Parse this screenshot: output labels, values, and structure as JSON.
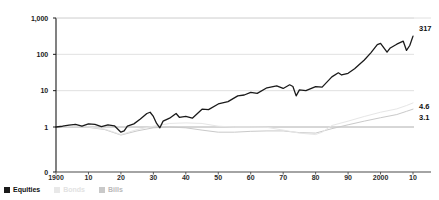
{
  "chart_data": {
    "type": "line",
    "title": "",
    "xlabel": "",
    "ylabel": "",
    "scale": "log",
    "grid": true,
    "legend_position": "bottom-left",
    "ylim": [
      1,
      1000
    ],
    "ytick_labels": [
      "1,000",
      "100",
      "10",
      "1",
      "0"
    ],
    "ytick_values": [
      1000,
      100,
      10,
      1,
      0
    ],
    "xlim": [
      1900,
      2010
    ],
    "xtick_labels": [
      "1900",
      "10",
      "20",
      "30",
      "40",
      "50",
      "60",
      "70",
      "80",
      "90",
      "2000",
      "10"
    ],
    "xtick_values": [
      1900,
      1910,
      1920,
      1930,
      1940,
      1950,
      1960,
      1970,
      1980,
      1990,
      2000,
      2010
    ],
    "end_labels": [
      {
        "name": "equities-end-value",
        "text": "317",
        "value": 317
      },
      {
        "name": "bonds-end-value",
        "text": "4.6",
        "value": 4.6
      },
      {
        "name": "bills-end-value",
        "text": "3.1",
        "value": 3.1
      }
    ],
    "series": [
      {
        "name": "Equities",
        "color": "#1a1a1a",
        "width": 1.3,
        "x": [
          1900,
          1902,
          1904,
          1906,
          1908,
          1910,
          1912,
          1914,
          1916,
          1918,
          1920,
          1921,
          1922,
          1924,
          1926,
          1928,
          1929,
          1930,
          1931,
          1932,
          1933,
          1935,
          1937,
          1938,
          1940,
          1942,
          1945,
          1947,
          1950,
          1953,
          1956,
          1958,
          1960,
          1962,
          1965,
          1968,
          1970,
          1972,
          1973,
          1974,
          1975,
          1977,
          1980,
          1982,
          1985,
          1987,
          1988,
          1990,
          1992,
          1995,
          1997,
          1999,
          2000,
          2002,
          2003,
          2005,
          2007,
          2008,
          2009,
          2010
        ],
        "y": [
          1.0,
          1.05,
          1.12,
          1.18,
          1.05,
          1.22,
          1.18,
          1.02,
          1.15,
          1.08,
          0.72,
          0.78,
          1.05,
          1.22,
          1.65,
          2.35,
          2.55,
          1.95,
          1.25,
          0.95,
          1.45,
          1.75,
          2.35,
          1.85,
          1.95,
          1.75,
          3.1,
          3.0,
          4.3,
          5.0,
          7.2,
          7.6,
          9.0,
          8.4,
          12.0,
          13.5,
          11.5,
          14.5,
          13.0,
          7.2,
          10.5,
          10.0,
          13.0,
          12.5,
          24.0,
          31.0,
          27.0,
          30.0,
          40.0,
          70.0,
          110.0,
          185.0,
          200.0,
          115.0,
          150.0,
          190.0,
          230.0,
          128.0,
          175.0,
          317.0
        ]
      },
      {
        "name": "Bonds",
        "color": "#e6e6e6",
        "width": 1.0,
        "x": [
          1900,
          1905,
          1910,
          1915,
          1920,
          1925,
          1930,
          1935,
          1940,
          1945,
          1950,
          1955,
          1960,
          1965,
          1970,
          1975,
          1980,
          1982,
          1985,
          1990,
          1995,
          2000,
          2005,
          2008,
          2010
        ],
        "y": [
          1.0,
          1.02,
          1.0,
          0.88,
          0.62,
          0.85,
          1.05,
          1.25,
          1.3,
          1.25,
          1.05,
          1.0,
          1.0,
          0.98,
          0.82,
          0.68,
          0.62,
          0.72,
          1.1,
          1.45,
          1.95,
          2.55,
          3.15,
          3.9,
          4.6
        ]
      },
      {
        "name": "Bills",
        "color": "#c9c9c9",
        "width": 1.0,
        "x": [
          1900,
          1905,
          1910,
          1915,
          1920,
          1925,
          1930,
          1935,
          1940,
          1945,
          1950,
          1955,
          1960,
          1965,
          1970,
          1975,
          1980,
          1985,
          1990,
          1995,
          2000,
          2005,
          2008,
          2010
        ],
        "y": [
          1.0,
          1.0,
          0.98,
          0.85,
          0.6,
          0.78,
          0.95,
          1.0,
          0.95,
          0.82,
          0.72,
          0.72,
          0.76,
          0.78,
          0.78,
          0.7,
          0.68,
          0.9,
          1.15,
          1.45,
          1.8,
          2.2,
          2.7,
          3.1
        ]
      }
    ]
  },
  "legend": {
    "items": [
      {
        "label": "Equities",
        "color": "#1a1a1a",
        "key": "equities"
      },
      {
        "label": "Bonds",
        "color": "#e2e2e2",
        "key": "bonds"
      },
      {
        "label": "Bills",
        "color": "#bdbdbd",
        "key": "bills"
      }
    ]
  },
  "axis": {
    "baseline_label": "0"
  }
}
